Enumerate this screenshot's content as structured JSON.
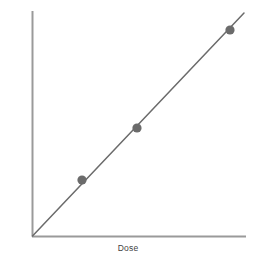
{
  "chart_data": {
    "type": "line",
    "title": "",
    "subtitle": "",
    "xlabel": "Dose",
    "ylabel": "Area under curve",
    "x": [
      0.38,
      0.7,
      1.0
    ],
    "y": [
      0.38,
      0.7,
      1.0
    ],
    "series": [
      {
        "name": "Dose proportionality",
        "x": [
          0,
          1.12
        ],
        "y": [
          0,
          1.12
        ],
        "marker_x": [
          0.38,
          0.7,
          1.0
        ],
        "marker_y": [
          0.38,
          0.7,
          1.0
        ]
      }
    ],
    "xlim": [
      0,
      1.12
    ],
    "ylim": [
      0,
      1.12
    ],
    "xticks": [],
    "yticks": [],
    "xticklabels": [],
    "yticklabels": [],
    "grid": false,
    "legend": false,
    "annotations": [],
    "relationship": "linear through origin",
    "colors": {
      "background": "#ffffff",
      "axis": "#9a9a9a",
      "line": "#6b6b6b",
      "marker": "#6b6b6b",
      "label_text": "#3f3f3f"
    },
    "geometry": {
      "origin_x": 32,
      "origin_y": 236,
      "y_axis_top": 11,
      "x_axis_right": 246,
      "line_end_x": 244,
      "line_end_y": 13,
      "marker_radius": 4.6,
      "marker_points": [
        {
          "cx": 82,
          "cy": 180
        },
        {
          "cx": 137,
          "cy": 128
        },
        {
          "cx": 230,
          "cy": 30
        }
      ]
    }
  }
}
